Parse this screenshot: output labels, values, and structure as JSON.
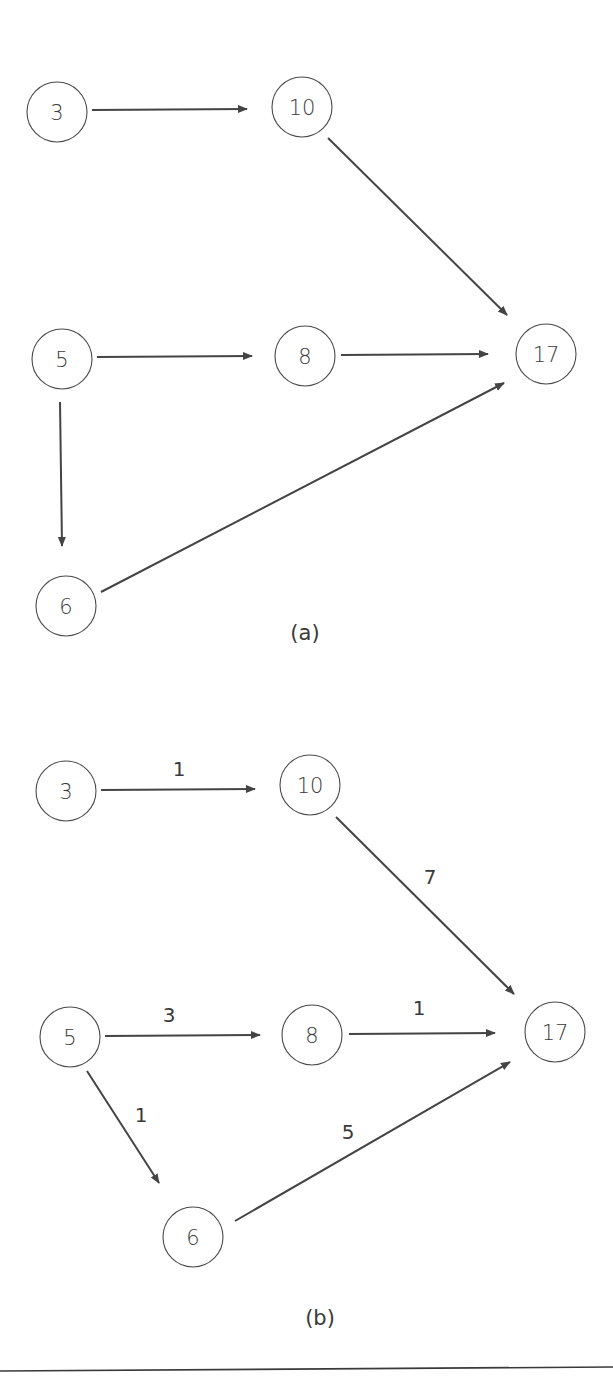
{
  "figure": {
    "width": 613,
    "height": 1391,
    "colors": {
      "stroke": "#444444",
      "text": "#3a3a3a",
      "background": "#ffffff"
    },
    "node_radius": 30,
    "panels": [
      {
        "id": "a",
        "caption": "(a)",
        "caption_pos": [
          305,
          633
        ],
        "nodes": [
          {
            "id": "a-3",
            "label": "3",
            "cx": 57,
            "cy": 112
          },
          {
            "id": "a-10",
            "label": "10",
            "cx": 302,
            "cy": 107
          },
          {
            "id": "a-5",
            "label": "5",
            "cx": 62,
            "cy": 359
          },
          {
            "id": "a-8",
            "label": "8",
            "cx": 305,
            "cy": 356
          },
          {
            "id": "a-17",
            "label": "17",
            "cx": 546,
            "cy": 354
          },
          {
            "id": "a-6",
            "label": "6",
            "cx": 66,
            "cy": 606
          }
        ],
        "edges": [
          {
            "from": "3",
            "to": "10",
            "x1": 92,
            "y1": 110,
            "x2": 247,
            "y2": 109,
            "label": null
          },
          {
            "from": "10",
            "to": "17",
            "x1": 328,
            "y1": 138,
            "x2": 507,
            "y2": 315,
            "label": null
          },
          {
            "from": "5",
            "to": "8",
            "x1": 97,
            "y1": 357,
            "x2": 252,
            "y2": 356,
            "label": null
          },
          {
            "from": "8",
            "to": "17",
            "x1": 341,
            "y1": 355,
            "x2": 488,
            "y2": 354,
            "label": null
          },
          {
            "from": "5",
            "to": "6",
            "x1": 60,
            "y1": 402,
            "x2": 62,
            "y2": 546,
            "label": null
          },
          {
            "from": "6",
            "to": "17",
            "x1": 101,
            "y1": 592,
            "x2": 504,
            "y2": 383,
            "label": null
          }
        ]
      },
      {
        "id": "b",
        "caption": "(b)",
        "caption_pos": [
          320,
          1318
        ],
        "nodes": [
          {
            "id": "b-3",
            "label": "3",
            "cx": 66,
            "cy": 791
          },
          {
            "id": "b-10",
            "label": "10",
            "cx": 310,
            "cy": 785
          },
          {
            "id": "b-5",
            "label": "5",
            "cx": 70,
            "cy": 1037
          },
          {
            "id": "b-8",
            "label": "8",
            "cx": 312,
            "cy": 1035
          },
          {
            "id": "b-17",
            "label": "17",
            "cx": 555,
            "cy": 1032
          },
          {
            "id": "b-6",
            "label": "6",
            "cx": 193,
            "cy": 1237
          }
        ],
        "edges": [
          {
            "from": "3",
            "to": "10",
            "x1": 101,
            "y1": 790,
            "x2": 255,
            "y2": 789,
            "label": "1",
            "lx": 179,
            "ly": 769
          },
          {
            "from": "10",
            "to": "17",
            "x1": 336,
            "y1": 817,
            "x2": 514,
            "y2": 994,
            "label": "7",
            "lx": 430,
            "ly": 877
          },
          {
            "from": "5",
            "to": "8",
            "x1": 105,
            "y1": 1036,
            "x2": 260,
            "y2": 1035,
            "label": "3",
            "lx": 169,
            "ly": 1015
          },
          {
            "from": "8",
            "to": "17",
            "x1": 349,
            "y1": 1034,
            "x2": 495,
            "y2": 1033,
            "label": "1",
            "lx": 419,
            "ly": 1008
          },
          {
            "from": "5",
            "to": "6",
            "x1": 87,
            "y1": 1071,
            "x2": 159,
            "y2": 1183,
            "label": "1",
            "lx": 141,
            "ly": 1115
          },
          {
            "from": "6",
            "to": "17",
            "x1": 235,
            "y1": 1221,
            "x2": 510,
            "y2": 1062,
            "label": "5",
            "lx": 348,
            "ly": 1132
          }
        ]
      }
    ],
    "bottom_rule": {
      "x1": 0,
      "y1": 1371,
      "x2": 613,
      "y2": 1367
    }
  }
}
